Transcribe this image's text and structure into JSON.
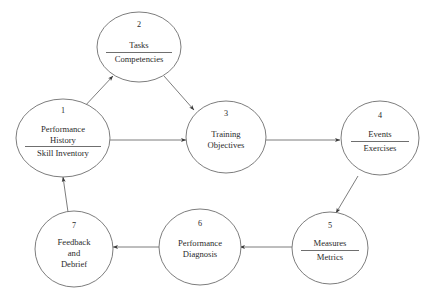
{
  "diagram": {
    "type": "cyclical-process-flow",
    "title": "",
    "node_shape": "ellipse",
    "colors": {
      "background": "#ffffff",
      "stroke": "#6e6e6e",
      "text": "#2a2a2a",
      "divider": "#4a4a4a"
    },
    "nodes": [
      {
        "index": "1",
        "lines_above": [
          "Performance",
          "History"
        ],
        "lines_below": [
          "Skill Inventory"
        ],
        "has_divider": true
      },
      {
        "index": "2",
        "lines_above": [
          "Tasks"
        ],
        "lines_below": [
          "Competencies"
        ],
        "has_divider": true
      },
      {
        "index": "3",
        "lines_above": [
          "Training",
          "Objectives"
        ],
        "lines_below": [],
        "has_divider": false
      },
      {
        "index": "4",
        "lines_above": [
          "Events"
        ],
        "lines_below": [
          "Exercises"
        ],
        "has_divider": true
      },
      {
        "index": "5",
        "lines_above": [
          "Measures"
        ],
        "lines_below": [
          "Metrics"
        ],
        "has_divider": true
      },
      {
        "index": "6",
        "lines_above": [
          "Performance",
          "Diagnosis"
        ],
        "lines_below": [],
        "has_divider": false
      },
      {
        "index": "7",
        "lines_above": [
          "Feedback",
          "and",
          "Debrief"
        ],
        "lines_below": [],
        "has_divider": false
      }
    ],
    "edges": [
      {
        "from": "1",
        "to": "2",
        "direction": "up-right"
      },
      {
        "from": "1",
        "to": "3",
        "direction": "right"
      },
      {
        "from": "2",
        "to": "3",
        "direction": "down-right"
      },
      {
        "from": "3",
        "to": "4",
        "direction": "right"
      },
      {
        "from": "4",
        "to": "5",
        "direction": "down-left"
      },
      {
        "from": "5",
        "to": "6",
        "direction": "left"
      },
      {
        "from": "6",
        "to": "7",
        "direction": "left"
      },
      {
        "from": "7",
        "to": "1",
        "direction": "up"
      }
    ]
  }
}
